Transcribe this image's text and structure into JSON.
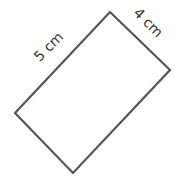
{
  "diagram": {
    "shape": "rectangle",
    "rotation_deg": 45,
    "stroke_color": "#555555",
    "fill_color": "#ffffff",
    "vertices": {
      "top": [
        110,
        12
      ],
      "right": [
        170,
        70
      ],
      "bottom": [
        73,
        173
      ],
      "left": [
        15,
        113
      ]
    },
    "labels": {
      "long_side": "5 cm",
      "short_side": "4 cm"
    }
  }
}
